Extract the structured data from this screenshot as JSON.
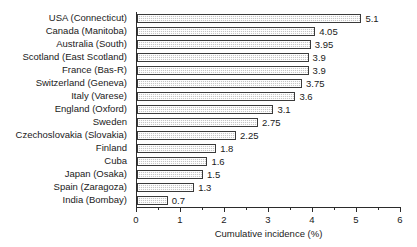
{
  "chart_data": {
    "type": "bar",
    "orientation": "horizontal",
    "title": "",
    "xlabel": "Cumulative incidence (%)",
    "ylabel": "",
    "xlim": [
      0,
      6
    ],
    "grid": false,
    "legend": null,
    "x_major_ticks": [
      "0",
      "1",
      "2",
      "3",
      "4",
      "5",
      "6"
    ],
    "x_minor_tick_interval": 0.5,
    "categories": [
      "USA (Connecticut)",
      "Canada (Manitoba)",
      "Australia (South)",
      "Scotland (East Scotland)",
      "France (Bas-R)",
      "Switzerland (Geneva)",
      "Italy (Varese)",
      "England (Oxford)",
      "Sweden",
      "Czechoslovakia (Slovakia)",
      "Finland",
      "Cuba",
      "Japan (Osaka)",
      "Spain (Zaragoza)",
      "India (Bombay)"
    ],
    "values": [
      5.1,
      4.05,
      3.95,
      3.9,
      3.9,
      3.75,
      3.6,
      3.1,
      2.75,
      2.25,
      1.8,
      1.6,
      1.5,
      1.3,
      0.7
    ],
    "value_labels": [
      "5.1",
      "4.05",
      "3.95",
      "3.9",
      "3.9",
      "3.75",
      "3.6",
      "3.1",
      "2.75",
      "2.25",
      "1.8",
      "1.6",
      "1.5",
      "1.3",
      "0.7"
    ],
    "bar_fill_color": "#c6c6c6",
    "bar_border_color": "#3a3a3a",
    "axis_color": "#2b2b2b",
    "text_color": "#1a1a1a",
    "background_color": "#ffffff"
  }
}
